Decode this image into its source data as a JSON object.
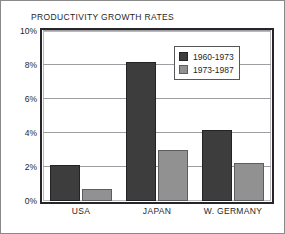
{
  "chart_data": {
    "type": "bar",
    "title": "PRODUCTIVITY GROWTH RATES",
    "xlabel": "",
    "ylabel": "",
    "categories": [
      "USA",
      "JAPAN",
      "W. GERMANY"
    ],
    "series": [
      {
        "name": "1960-1973",
        "color": "#3d3d3d",
        "values": [
          2.1,
          8.2,
          4.2
        ]
      },
      {
        "name": "1973-1987",
        "color": "#919191",
        "values": [
          0.7,
          3.0,
          2.25
        ]
      }
    ],
    "ylim": [
      0,
      10
    ],
    "ytick_values": [
      0,
      2,
      4,
      6,
      8,
      10
    ],
    "ytick_labels": [
      "0%",
      "2%",
      "4%",
      "6%",
      "8%",
      "10%"
    ],
    "grid": true,
    "grid_axis": "y",
    "legend_position": "top-right",
    "legend_entries": [
      "1960-1973",
      "1973-1987"
    ],
    "annotations": []
  },
  "figure": {
    "background": "#ffffff",
    "border_color": "#8a8a8a",
    "plot_border_color": "#26262a",
    "gridline_color": "#9d9da2"
  }
}
